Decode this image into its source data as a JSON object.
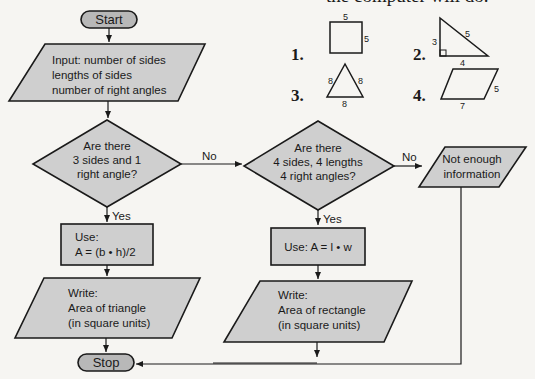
{
  "header": {
    "text": "the computer will do."
  },
  "flowchart": {
    "start": "Start",
    "input": [
      "Input: number of sides",
      "lengths of sides",
      "number of right angles"
    ],
    "decision1": [
      "Are there",
      "3 sides and 1",
      "right angle?"
    ],
    "decision1_no": "No",
    "decision1_yes": "Yes",
    "process1": [
      "Use:",
      "A = (b • h)/2"
    ],
    "output1": [
      "Write:",
      "Area of triangle",
      "(in square units)"
    ],
    "decision2": [
      "Are there",
      "4 sides, 4 lengths",
      "4 right angles?"
    ],
    "decision2_no": "No",
    "decision2_yes": "Yes",
    "process2": "Use: A = l • w",
    "output2": [
      "Write:",
      "Area of rectangle",
      "(in square units)"
    ],
    "output3": [
      "Not enough",
      "information"
    ],
    "stop": "Stop"
  },
  "figures": [
    {
      "number": "1.",
      "shape": "square",
      "labels": [
        "5",
        "5"
      ]
    },
    {
      "number": "2.",
      "shape": "right-triangle",
      "labels": [
        "3",
        "5",
        "4"
      ]
    },
    {
      "number": "3.",
      "shape": "equilateral-triangle",
      "labels": [
        "8",
        "8",
        "8"
      ]
    },
    {
      "number": "4.",
      "shape": "parallelogram",
      "labels": [
        "5",
        "7"
      ]
    }
  ],
  "colors": {
    "shape_fill": "#cfcfcf",
    "terminal_fill": "#b8b8b8",
    "stroke": "#1a1a1a",
    "background": "#f6f5f2"
  }
}
